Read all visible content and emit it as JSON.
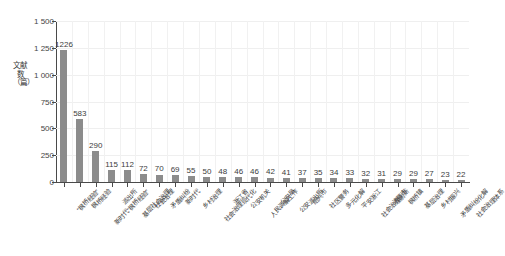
{
  "chart_data": {
    "type": "bar",
    "title": "",
    "subtitle": "",
    "xlabel": "",
    "ylabel": "文献数（篇）",
    "ylim": [
      0,
      1500
    ],
    "yticks": [
      0,
      250,
      500,
      750,
      1000,
      1250,
      1500
    ],
    "ytick_labels": [
      "0",
      "250",
      "500",
      "750",
      "1 000",
      "1 250",
      "1 500"
    ],
    "grid": true,
    "legend": null,
    "bar_color": "#8c8c8c",
    "categories": [
      "“枫桥经验”",
      "枫桥经验",
      "新时代“枫桥经验”",
      "派出所",
      "基层社会治理",
      "社会治理",
      "矛盾纠纷",
      "新时代",
      "乡村治理",
      "社会治理现代化",
      "浙江省",
      "公安机关",
      "人民调解工作",
      "公安局",
      "公安派出所",
      "绍兴市",
      "社区警务",
      "多元化解",
      "平安浙江",
      "社会治理创新",
      "诸暨市",
      "枫桥镇",
      "基层治理",
      "乡村振兴",
      "矛盾纠纷化解",
      "社会治理体系"
    ],
    "values": [
      1226,
      583,
      290,
      115,
      112,
      72,
      70,
      69,
      55,
      50,
      48,
      46,
      46,
      42,
      41,
      37,
      35,
      34,
      33,
      32,
      31,
      29,
      29,
      27,
      23,
      22
    ],
    "value_labels": [
      "1226",
      "583",
      "290",
      "115",
      "112",
      "72",
      "70",
      "69",
      "55",
      "50",
      "48",
      "46",
      "46",
      "42",
      "41",
      "37",
      "35",
      "34",
      "33",
      "32",
      "31",
      "29",
      "29",
      "27",
      "23",
      "22"
    ]
  }
}
